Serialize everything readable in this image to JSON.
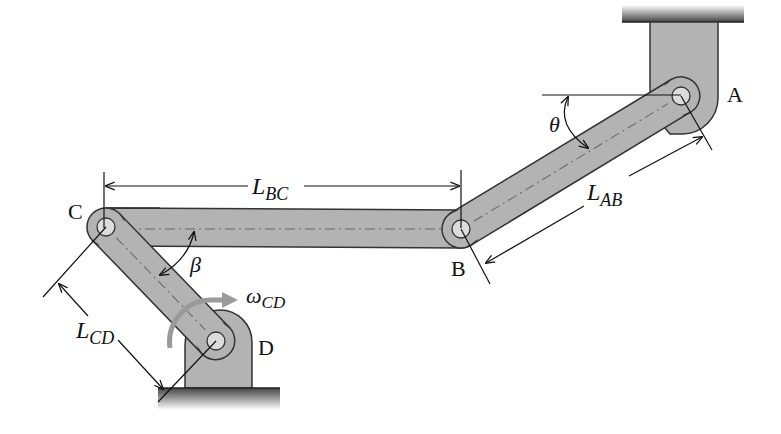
{
  "diagram": {
    "type": "four-bar linkage mechanism",
    "points": {
      "A": {
        "label": "A",
        "x": 681,
        "y": 96
      },
      "B": {
        "label": "B",
        "x": 461,
        "y": 229
      },
      "C": {
        "label": "C",
        "x": 106,
        "y": 227
      },
      "D": {
        "label": "D",
        "x": 216,
        "y": 341
      }
    },
    "links": [
      {
        "name": "AB",
        "from": "A",
        "to": "B"
      },
      {
        "name": "BC",
        "from": "B",
        "to": "C"
      },
      {
        "name": "CD",
        "from": "C",
        "to": "D"
      }
    ],
    "dimensions": {
      "L_AB": {
        "main": "L",
        "sub": "AB"
      },
      "L_BC": {
        "main": "L",
        "sub": "BC"
      },
      "L_CD": {
        "main": "L",
        "sub": "CD"
      }
    },
    "angles": {
      "theta": "θ",
      "beta": "β"
    },
    "angular_velocity": {
      "main": "ω",
      "sub": "CD"
    },
    "colors": {
      "link_fill": "#b3b3b3",
      "link_stroke": "#333333",
      "pin_fill": "#dcdcdc",
      "ground": "#555555",
      "omega_arrow": "#9a9a9a"
    }
  }
}
